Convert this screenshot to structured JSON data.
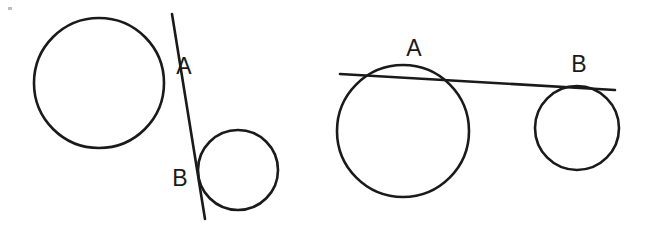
{
  "figure": {
    "background_color": "#ffffff",
    "stroke_color": "#1a1a1a",
    "stroke_width": 2.6,
    "width": 648,
    "height": 230,
    "panels": [
      {
        "id": "left-panel",
        "name": "internal-tangent-diagram",
        "description": "Two externally separated circles with a common internal tangent line crossing between them",
        "circles": [
          {
            "name": "large-circle",
            "cx": 99,
            "cy": 83,
            "r": 65
          },
          {
            "name": "small-circle",
            "cx": 238,
            "cy": 170,
            "r": 40
          }
        ],
        "tangent_line": {
          "x1": 172,
          "y1": 14,
          "x2": 205,
          "y2": 219
        },
        "labels": [
          {
            "text": "A",
            "x": 184,
            "y": 74,
            "point_name": "tangent-point-a"
          },
          {
            "text": "B",
            "x": 180,
            "y": 186,
            "point_name": "tangent-point-b"
          }
        ]
      },
      {
        "id": "right-panel",
        "name": "external-tangent-diagram",
        "description": "Two externally separated circles with a common external tangent line touching the upper sides",
        "circles": [
          {
            "name": "large-circle",
            "cx": 403,
            "cy": 131,
            "r": 66
          },
          {
            "name": "small-circle",
            "cx": 577,
            "cy": 128,
            "r": 42
          }
        ],
        "tangent_line": {
          "x1": 340,
          "y1": 74,
          "x2": 615,
          "y2": 90
        },
        "labels": [
          {
            "text": "A",
            "x": 414,
            "y": 56,
            "point_name": "tangent-point-a"
          },
          {
            "text": "B",
            "x": 579,
            "y": 72,
            "point_name": "tangent-point-b"
          }
        ]
      }
    ]
  }
}
